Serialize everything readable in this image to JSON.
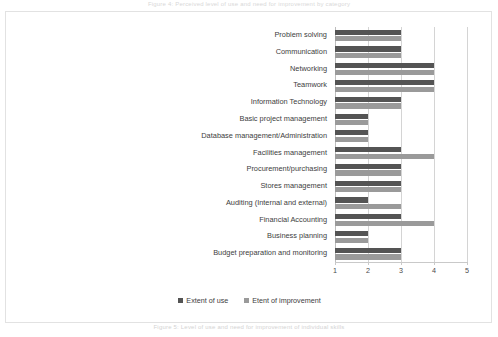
{
  "page": {
    "caption_top": "Figure 4: Perceived level of use and need for improvement by category",
    "caption_bottom": "Figure 5: Level of use and need for improvement of individual skills"
  },
  "chart_data": {
    "type": "bar",
    "orientation": "horizontal",
    "title": "",
    "xlabel": "",
    "ylabel": "",
    "xlim": [
      1,
      5
    ],
    "xticks": [
      "1",
      "2",
      "3",
      "4",
      "5"
    ],
    "grid": true,
    "legend_position": "bottom",
    "categories": [
      "Problem solving",
      "Communication",
      "Networking",
      "Teamwork",
      "Information Technology",
      "Basic project management",
      "Database management/Administration",
      "Facilities management",
      "Procurement/purchasing",
      "Stores management",
      "Auditing (Internal and external)",
      "Financial Accounting",
      "Business planning",
      "Budget preparation and monitoring"
    ],
    "series": [
      {
        "name": "Extent of use",
        "color": "#545454",
        "values": [
          3,
          3,
          4,
          4,
          3,
          2,
          2,
          3,
          3,
          3,
          2,
          3,
          2,
          3
        ]
      },
      {
        "name": "Etent of improvement",
        "color": "#9a9a9a",
        "values": [
          3,
          3,
          4,
          4,
          3,
          2,
          2,
          4,
          3,
          3,
          3,
          4,
          2,
          3
        ]
      }
    ]
  }
}
